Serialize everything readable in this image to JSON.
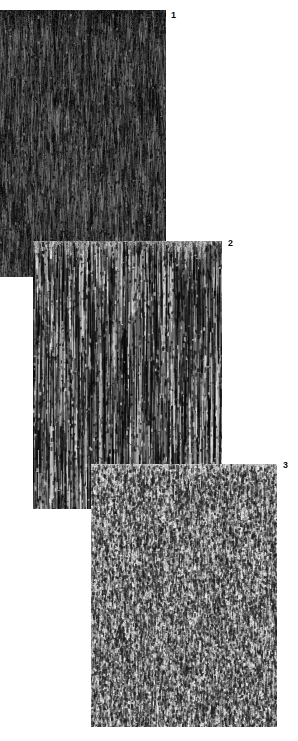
{
  "figure": {
    "kind": "micrograph-plate",
    "background_color": "#ffffff",
    "width": 298,
    "height": 741,
    "panel_count": 3,
    "stacking_order": [
      "panel-1",
      "panel-2",
      "panel-3"
    ]
  },
  "panels": [
    {
      "id": "panel-1",
      "label": "1",
      "x": 0,
      "y": 10,
      "width": 166,
      "height": 267,
      "base_color": "#1c1c1c",
      "mean_tone": "very-dark",
      "streak_color": "#8d8d8d",
      "texture": "fine dense vertical fibrous grain, near-black with faint pale vertical streaks",
      "label_x": 171,
      "label_y": 11
    },
    {
      "id": "panel-2",
      "label": "2",
      "x": 33,
      "y": 241,
      "width": 189,
      "height": 268,
      "base_color": "#8a8a8a",
      "mean_tone": "mid-gray",
      "streak_color": "#121212",
      "texture": "coarse high-contrast vertical striations, mid-gray matrix with strong black bands",
      "label_x": 228,
      "label_y": 239
    },
    {
      "id": "panel-3",
      "label": "3",
      "x": 91,
      "y": 464,
      "width": 186,
      "height": 263,
      "base_color": "#bcbcbc",
      "mean_tone": "light-gray",
      "streak_color": "#303030",
      "texture": "light gray matrix with short dark dashes and fine speckles, weak vertical alignment",
      "label_x": 283,
      "label_y": 461
    }
  ]
}
